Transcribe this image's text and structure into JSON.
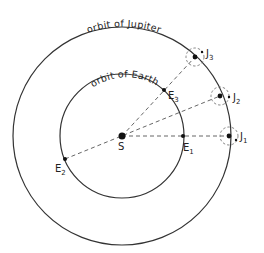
{
  "diagram": {
    "labels": {
      "jupiter_orbit": "orbit of Jupiter",
      "earth_orbit": "orbit of Earth",
      "sun": "S",
      "earth_positions": [
        {
          "letter": "E",
          "sub": "1"
        },
        {
          "letter": "E",
          "sub": "2"
        },
        {
          "letter": "E",
          "sub": "3"
        }
      ],
      "jupiter_positions": [
        {
          "letter": "J",
          "sub": "1"
        },
        {
          "letter": "J",
          "sub": "2"
        },
        {
          "letter": "J",
          "sub": "3"
        }
      ]
    },
    "colors": {
      "line": "#333333",
      "background": "#ffffff"
    }
  }
}
